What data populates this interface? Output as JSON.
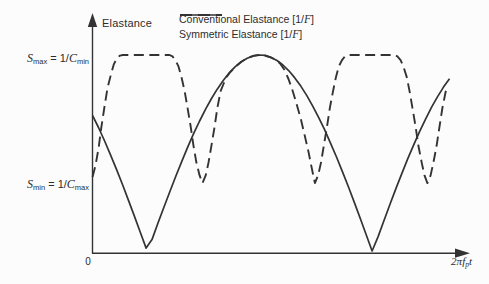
{
  "figure": {
    "y_axis_label": "Elastance",
    "origin_label": "0",
    "x_axis_label": {
      "pre": "2π",
      "var_f": "f",
      "sub_p": "p",
      "var_t": "t"
    },
    "smax_label": {
      "s": "S",
      "s_sub": "max",
      "mid": " = 1/",
      "c": "C",
      "c_sub": "min"
    },
    "smin_label": {
      "s": "S",
      "s_sub": "min",
      "mid": " = 1/",
      "c": "C",
      "c_sub": "max"
    },
    "legend": [
      {
        "style": "solid",
        "pre": "Conventional Elastance [1/",
        "unit": "F",
        "post": "]"
      },
      {
        "style": "dashed",
        "pre": "Symmetric Elastance [1/",
        "unit": "F",
        "post": "]"
      }
    ]
  },
  "colors": {
    "ink": "#333333",
    "text": "#2d2d2d",
    "background": "#fcfcfc"
  },
  "chart_data": {
    "type": "line",
    "title": "",
    "xlabel": "2πf_p·t",
    "ylabel": "Elastance",
    "x_axis": {
      "origin_tick": "0",
      "end_label": "2πf_p·t",
      "range_norm": [
        0,
        1
      ]
    },
    "y_axis": {
      "range_norm": [
        0,
        1.05
      ],
      "grid": false
    },
    "legend_position": "top",
    "y_annotations": [
      {
        "text": "S_max = 1/C_min",
        "level_norm": 1.0
      },
      {
        "text": "S_min = 1/C_max",
        "level_norm": 0.35
      }
    ],
    "series": [
      {
        "name": "Conventional Elastance [1/F]",
        "line_style": "solid",
        "x_sampling": "uniform_0_to_1",
        "y_norm": [
          0.694,
          0.632,
          0.566,
          0.496,
          0.422,
          0.345,
          0.266,
          0.185,
          0.103,
          0.02,
          0.063,
          0.146,
          0.227,
          0.307,
          0.385,
          0.46,
          0.532,
          0.601,
          0.665,
          0.725,
          0.779,
          0.828,
          0.872,
          0.91,
          0.941,
          0.966,
          0.984,
          0.995,
          1.0,
          0.998,
          0.988,
          0.972,
          0.949,
          0.92,
          0.884,
          0.842,
          0.795,
          0.742,
          0.683,
          0.621,
          0.553,
          0.482,
          0.408,
          0.331,
          0.252,
          0.17,
          0.088,
          0.005,
          0.078,
          0.161,
          0.242,
          0.322,
          0.399,
          0.474,
          0.545,
          0.613,
          0.676,
          0.735,
          0.789,
          0.837,
          0.879
        ]
      },
      {
        "name": "Symmetric Elastance [1/F]",
        "line_style": "dashed",
        "points_norm": [
          [
            0.0,
            0.381
          ],
          [
            0.008,
            0.437
          ],
          [
            0.017,
            0.528
          ],
          [
            0.025,
            0.635
          ],
          [
            0.034,
            0.741
          ],
          [
            0.042,
            0.832
          ],
          [
            0.052,
            0.904
          ],
          [
            0.06,
            0.954
          ],
          [
            0.069,
            0.985
          ],
          [
            0.077,
            0.997
          ],
          [
            0.085,
            1.0
          ],
          [
            0.216,
            1.0
          ],
          [
            0.224,
            0.993
          ],
          [
            0.232,
            0.974
          ],
          [
            0.241,
            0.942
          ],
          [
            0.249,
            0.889
          ],
          [
            0.258,
            0.818
          ],
          [
            0.266,
            0.733
          ],
          [
            0.275,
            0.636
          ],
          [
            0.283,
            0.539
          ],
          [
            0.291,
            0.454
          ],
          [
            0.3,
            0.389
          ],
          [
            0.308,
            0.35
          ],
          [
            0.317,
            0.389
          ],
          [
            0.325,
            0.454
          ],
          [
            0.333,
            0.539
          ],
          [
            0.342,
            0.636
          ],
          [
            0.35,
            0.733
          ],
          [
            0.359,
            0.818
          ],
          [
            0.367,
            0.853
          ],
          [
            0.375,
            0.888
          ],
          [
            0.384,
            0.909
          ],
          [
            0.401,
            0.941
          ],
          [
            0.417,
            0.966
          ],
          [
            0.434,
            0.985
          ],
          [
            0.451,
            0.996
          ],
          [
            0.468,
            1.0
          ],
          [
            0.485,
            0.996
          ],
          [
            0.501,
            0.987
          ],
          [
            0.518,
            0.97
          ],
          [
            0.527,
            0.954
          ],
          [
            0.538,
            0.924
          ],
          [
            0.549,
            0.878
          ],
          [
            0.56,
            0.822
          ],
          [
            0.571,
            0.756
          ],
          [
            0.583,
            0.68
          ],
          [
            0.594,
            0.594
          ],
          [
            0.605,
            0.508
          ],
          [
            0.613,
            0.437
          ],
          [
            0.623,
            0.35
          ],
          [
            0.632,
            0.389
          ],
          [
            0.64,
            0.454
          ],
          [
            0.648,
            0.539
          ],
          [
            0.657,
            0.636
          ],
          [
            0.665,
            0.733
          ],
          [
            0.674,
            0.818
          ],
          [
            0.682,
            0.889
          ],
          [
            0.69,
            0.942
          ],
          [
            0.699,
            0.974
          ],
          [
            0.707,
            0.993
          ],
          [
            0.716,
            1.0
          ],
          [
            0.846,
            1.0
          ],
          [
            0.854,
            0.993
          ],
          [
            0.863,
            0.974
          ],
          [
            0.871,
            0.942
          ],
          [
            0.88,
            0.889
          ],
          [
            0.888,
            0.818
          ],
          [
            0.896,
            0.733
          ],
          [
            0.905,
            0.636
          ],
          [
            0.913,
            0.539
          ],
          [
            0.922,
            0.454
          ],
          [
            0.93,
            0.389
          ],
          [
            0.938,
            0.35
          ],
          [
            0.947,
            0.389
          ],
          [
            0.955,
            0.454
          ],
          [
            0.964,
            0.539
          ],
          [
            0.972,
            0.636
          ],
          [
            0.98,
            0.731
          ],
          [
            0.989,
            0.812
          ],
          [
            0.994,
            0.832
          ]
        ]
      }
    ]
  }
}
